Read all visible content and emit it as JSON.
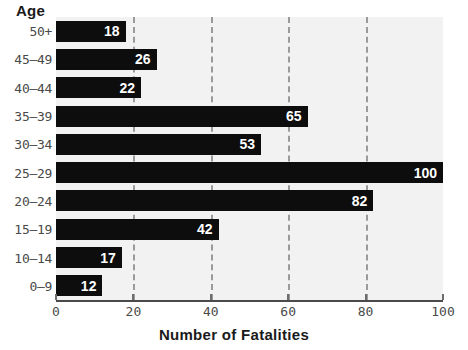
{
  "chart_data": {
    "type": "bar",
    "orientation": "horizontal",
    "title": "",
    "xlabel": "Number of Fatalities",
    "ylabel": "Age",
    "categories": [
      "50+",
      "45–49",
      "40–44",
      "35–39",
      "30–34",
      "25–29",
      "20–24",
      "15–19",
      "10–14",
      "0–9"
    ],
    "values": [
      18,
      26,
      22,
      65,
      53,
      100,
      82,
      42,
      17,
      12
    ],
    "value_labels": [
      "18",
      "26",
      "22",
      "65",
      "53",
      "100",
      "82",
      "42",
      "17",
      "12"
    ],
    "xlim": [
      0,
      100
    ],
    "xticks": [
      0,
      20,
      40,
      60,
      80,
      100
    ],
    "xtick_labels": [
      "0",
      "20",
      "40",
      "60",
      "80",
      "100"
    ],
    "grid": "vertical-dashed",
    "legend": "none",
    "bar_color": "#0d0d0d",
    "plot_background": "#f2f2f2",
    "gridline_color": "#9a9a9a",
    "value_label_color": "#ffffff"
  }
}
